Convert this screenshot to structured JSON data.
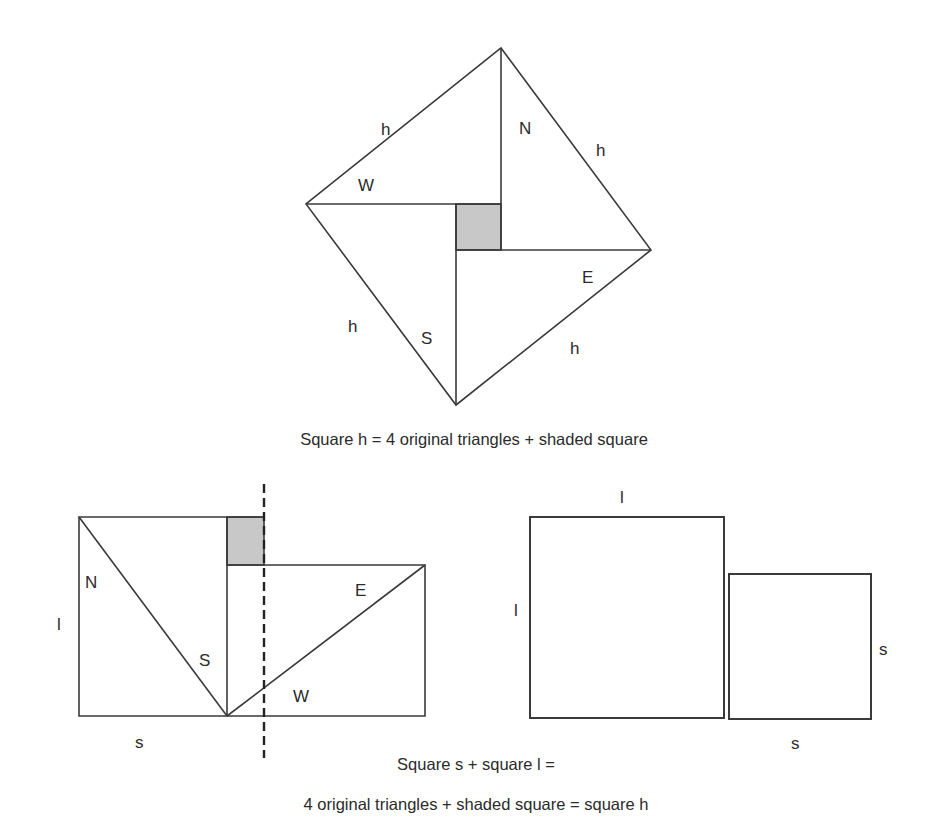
{
  "figure_top": {
    "name": "square-h-construction",
    "labels": {
      "h_top_left": "h",
      "h_top_right": "h",
      "h_bottom_left": "h",
      "h_bottom_right": "h",
      "N": "N",
      "W": "W",
      "E": "E",
      "S": "S"
    },
    "caption": "Square h = 4 original triangles + shaded square"
  },
  "figure_bottom_left": {
    "name": "rearranged-triangles",
    "labels": {
      "l": "l",
      "s": "s",
      "N": "N",
      "S": "S",
      "E": "E",
      "W": "W"
    }
  },
  "figure_bottom_right": {
    "name": "square-l-and-square-s",
    "labels": {
      "l_top": "l",
      "l_left": "l",
      "s_right": "s",
      "s_bottom": "s"
    }
  },
  "caption_bottom": {
    "line1": "Square s + square l =",
    "line2": "4 original triangles + shaded square = square h"
  },
  "colors": {
    "stroke": "#3a3a3a",
    "shade": "#c8c8c8",
    "text": "#2b2b2b"
  }
}
